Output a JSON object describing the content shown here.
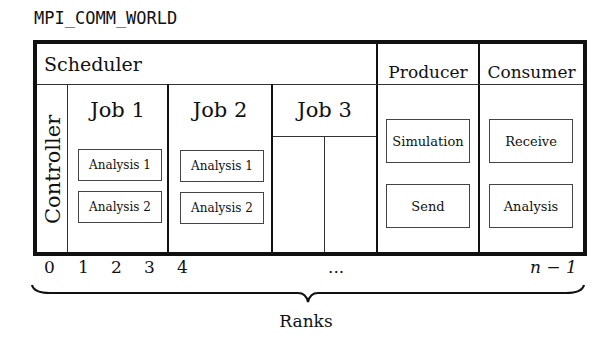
{
  "title": "MPI_COMM_WORLD",
  "scheduler": {
    "label": "Scheduler"
  },
  "controller": {
    "label": "Controller"
  },
  "jobs": [
    {
      "label": "Job 1",
      "tasks": [
        "Analysis 1",
        "Analysis 2"
      ]
    },
    {
      "label": "Job 2",
      "tasks": [
        "Analysis 1",
        "Analysis 2"
      ]
    },
    {
      "label": "Job 3",
      "tasks": []
    }
  ],
  "producer": {
    "label": "Producer",
    "tasks": [
      "Simulation",
      "Send"
    ]
  },
  "consumer": {
    "label": "Consumer",
    "tasks": [
      "Receive",
      "Analysis"
    ]
  },
  "ranks": {
    "labels": [
      "0",
      "1",
      "2",
      "3",
      "4",
      "...",
      "n − 1"
    ],
    "caption": "Ranks"
  }
}
